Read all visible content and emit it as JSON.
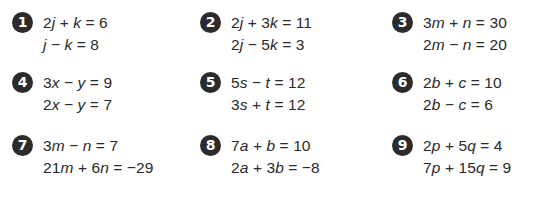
{
  "problems": [
    {
      "number": "1",
      "equations": [
        "2j + k = 6",
        "j − k = 8"
      ],
      "variables": [
        "j",
        "k"
      ]
    },
    {
      "number": "2",
      "equations": [
        "2j + 3k = 11",
        "2j − 5k = 3"
      ],
      "variables": [
        "j",
        "k"
      ]
    },
    {
      "number": "3",
      "equations": [
        "3m + n = 30",
        "2m − n = 20"
      ],
      "variables": [
        "m",
        "n"
      ]
    },
    {
      "number": "4",
      "equations": [
        "3x − y = 9",
        "2x − y = 7"
      ],
      "variables": [
        "x",
        "y"
      ]
    },
    {
      "number": "5",
      "equations": [
        "5s − t = 12",
        "3s + t = 12"
      ],
      "variables": [
        "s",
        "t"
      ]
    },
    {
      "number": "6",
      "equations": [
        "2b + c = 10",
        "2b − c = 6"
      ],
      "variables": [
        "b",
        "c"
      ]
    },
    {
      "number": "7",
      "equations": [
        "3m − n = 7",
        "21m + 6n = −29"
      ],
      "variables": [
        "m",
        "n"
      ]
    },
    {
      "number": "8",
      "equations": [
        "7a + b = 10",
        "2a + 3b = −8"
      ],
      "variables": [
        "a",
        "b"
      ]
    },
    {
      "number": "9",
      "equations": [
        "2p + 5q = 4",
        "7p + 15q = 9"
      ],
      "variables": [
        "p",
        "q"
      ]
    }
  ],
  "colors": {
    "badge": "#2b2b2b",
    "text": "#2a2a2a",
    "background": "#ffffff"
  }
}
